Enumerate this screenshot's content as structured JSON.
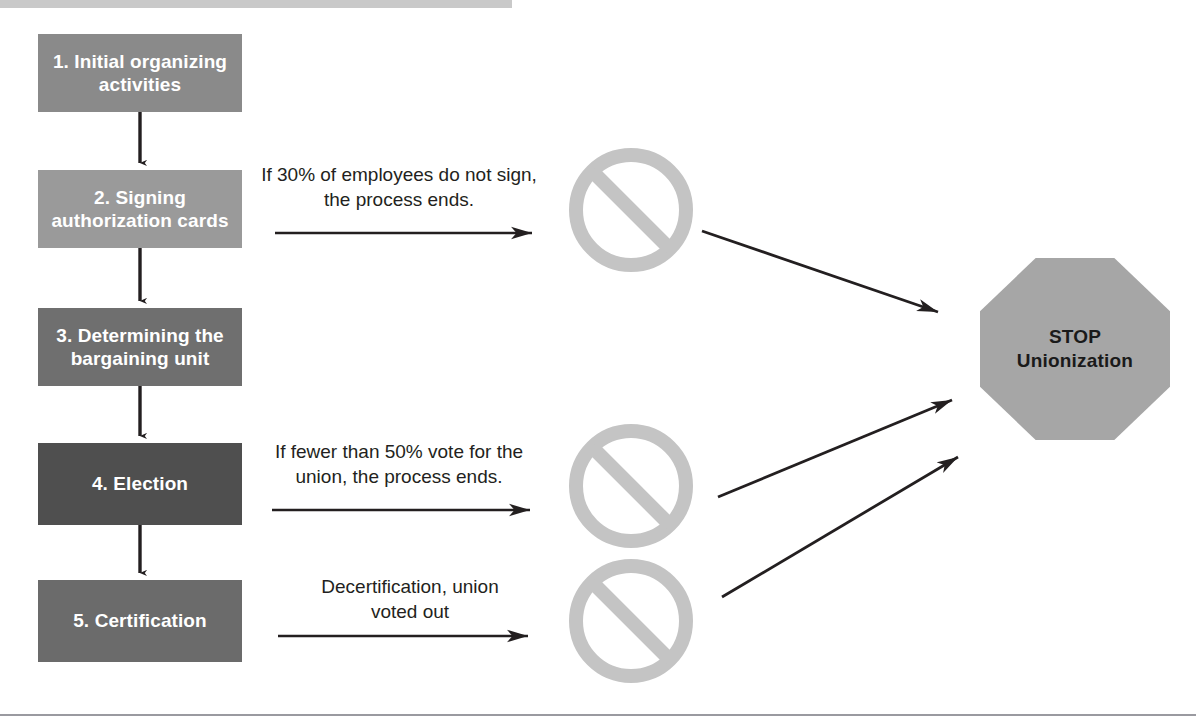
{
  "diagram": {
    "colors": {
      "box_light": "#8a8a8a",
      "box_mid": "#6f6f6f",
      "box_dark": "#5a5a5a",
      "box_darkest": "#4a4a4a",
      "prohibition_sign": "#c4c4c4",
      "stop_sign_fill": "#a6a6a6",
      "stop_sign_border": "#ffffff",
      "arrow": "#231f20",
      "text_on_box": "#ffffff",
      "text_label": "#231f20",
      "top_rule": "#c9c9c9",
      "bottom_rule": "#9a9aa0"
    },
    "steps": [
      {
        "id": "step-1",
        "label": "1. Initial organizing activities",
        "x": 38,
        "y": 34,
        "w": 204,
        "h": 78,
        "fill": "#8a8a8a"
      },
      {
        "id": "step-2",
        "label": "2. Signing authorization cards",
        "x": 38,
        "y": 170,
        "w": 204,
        "h": 78,
        "fill": "#9a9a9a"
      },
      {
        "id": "step-3",
        "label": "3. Determining the bargaining unit",
        "x": 38,
        "y": 308,
        "w": 204,
        "h": 78,
        "fill": "#6f6f6f"
      },
      {
        "id": "step-4",
        "label": "4. Election",
        "x": 38,
        "y": 443,
        "w": 204,
        "h": 82,
        "fill": "#4f4f4f"
      },
      {
        "id": "step-5",
        "label": "5. Certification",
        "x": 38,
        "y": 580,
        "w": 204,
        "h": 82,
        "fill": "#6b6b6b"
      }
    ],
    "edge_labels": [
      {
        "id": "label-1",
        "text": "If 30% of employees do not sign, the process ends.",
        "x": 250,
        "y": 163,
        "w": 298
      },
      {
        "id": "label-2",
        "text": "If fewer than 50% vote for the union, the process ends.",
        "x": 252,
        "y": 440,
        "w": 294
      },
      {
        "id": "label-3",
        "text": "Decertification, union voted out",
        "x": 300,
        "y": 575,
        "w": 220
      }
    ],
    "prohibition_signs": [
      {
        "id": "prohibit-1",
        "name": "prohibition-sign-cards",
        "cx": 631,
        "cy": 210,
        "r": 62
      },
      {
        "id": "prohibit-2",
        "name": "prohibition-sign-election",
        "cx": 631,
        "cy": 486,
        "r": 62
      },
      {
        "id": "prohibit-3",
        "name": "prohibition-sign-decertification",
        "cx": 631,
        "cy": 621,
        "r": 62
      }
    ],
    "stop_sign": {
      "line1": "STOP",
      "line2": "Unionization",
      "x": 975,
      "y": 253,
      "w": 200,
      "h": 192
    },
    "vertical_arrows": [
      {
        "id": "v-arrow-1-2",
        "x": 140,
        "y1": 112,
        "y2": 168
      },
      {
        "id": "v-arrow-2-3",
        "x": 140,
        "y1": 248,
        "y2": 306
      },
      {
        "id": "v-arrow-3-4",
        "x": 140,
        "y1": 386,
        "y2": 441
      },
      {
        "id": "v-arrow-4-5",
        "x": 140,
        "y1": 525,
        "y2": 578
      }
    ],
    "horizontal_arrows": [
      {
        "id": "h-arrow-1",
        "x1": 275,
        "x2": 532,
        "y": 233
      },
      {
        "id": "h-arrow-2",
        "x1": 272,
        "x2": 530,
        "y": 510
      },
      {
        "id": "h-arrow-3",
        "x1": 278,
        "x2": 528,
        "y": 636
      }
    ],
    "diagonal_arrows": [
      {
        "id": "d-arrow-1",
        "x1": 702,
        "y1": 231,
        "x2": 938,
        "y2": 312
      },
      {
        "id": "d-arrow-2",
        "x1": 718,
        "y1": 497,
        "x2": 952,
        "y2": 400
      },
      {
        "id": "d-arrow-3",
        "x1": 722,
        "y1": 597,
        "x2": 958,
        "y2": 457
      }
    ]
  }
}
